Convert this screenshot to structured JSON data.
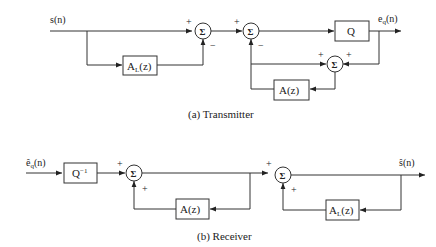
{
  "transmitter": {
    "caption": "(a) Transmitter",
    "input_signal": "s(n)",
    "output_signal_main": "e",
    "output_signal_sub": "q",
    "output_signal_tail": "(n)",
    "blocks": {
      "long_term_predictor_main": "A",
      "long_term_predictor_sub": "L",
      "long_term_predictor_tail": "(z)",
      "quantizer": "Q",
      "short_term_predictor": "A(z)"
    },
    "summers": [
      "Σ",
      "Σ",
      "Σ"
    ],
    "signs": {
      "sum1_top": "+",
      "sum1_bottom": "−",
      "sum2_top": "+",
      "sum2_bottom": "−",
      "sum3_left": "+",
      "sum3_right": "+"
    }
  },
  "receiver": {
    "caption": "(b) Receiver",
    "input_signal_main": "ê",
    "input_signal_sub": "q",
    "input_signal_tail": "(n)",
    "output_signal": "ŝ(n)",
    "blocks": {
      "inverse_quantizer_main": "Q",
      "inverse_quantizer_sup": "−1",
      "short_term_predictor": "A(z)",
      "long_term_predictor_main": "A",
      "long_term_predictor_sub": "L",
      "long_term_predictor_tail": "(z)"
    },
    "summers": [
      "Σ",
      "Σ"
    ],
    "signs": {
      "sum1_top": "+",
      "sum1_bottom": "+",
      "sum2_top": "+",
      "sum2_bottom": "+"
    }
  }
}
